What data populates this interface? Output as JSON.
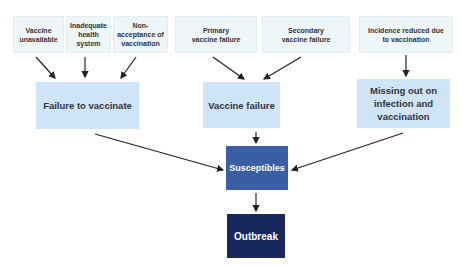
{
  "diagram": {
    "top_causes": [
      {
        "id": "vaccine-unavailable",
        "label": "Vaccine unavailable"
      },
      {
        "id": "inadequate-health-system",
        "label": "Inadequate health system"
      },
      {
        "id": "non-acceptance",
        "label": "Non-acceptance of vaccination"
      },
      {
        "id": "primary-vaccine-failure",
        "label": "Primary vaccine failure"
      },
      {
        "id": "secondary-vaccine-failure",
        "label": "Secondary vaccine failure"
      },
      {
        "id": "incidence-reduced",
        "label": "Incidence reduced due to vaccination"
      }
    ],
    "mid_categories": [
      {
        "id": "failure-to-vaccinate",
        "label": "Failure to vaccinate"
      },
      {
        "id": "vaccine-failure",
        "label": "Vaccine failure"
      },
      {
        "id": "missing-out",
        "label": "Missing out on infection and vaccination"
      }
    ],
    "susceptibles": {
      "label": "Susceptibles"
    },
    "outbreak": {
      "label": "Outbreak"
    },
    "colors": {
      "top_box": "#eef6f9",
      "mid_box": "#cfe4f6",
      "susceptibles_box": "#3a5ea3",
      "outbreak_box": "#18285a",
      "arrow": "#222222"
    },
    "edges": [
      [
        "vaccine-unavailable",
        "failure-to-vaccinate"
      ],
      [
        "inadequate-health-system",
        "failure-to-vaccinate"
      ],
      [
        "non-acceptance",
        "failure-to-vaccinate"
      ],
      [
        "primary-vaccine-failure",
        "vaccine-failure"
      ],
      [
        "secondary-vaccine-failure",
        "vaccine-failure"
      ],
      [
        "incidence-reduced",
        "missing-out"
      ],
      [
        "failure-to-vaccinate",
        "susceptibles"
      ],
      [
        "vaccine-failure",
        "susceptibles"
      ],
      [
        "missing-out",
        "susceptibles"
      ],
      [
        "susceptibles",
        "outbreak"
      ]
    ]
  }
}
